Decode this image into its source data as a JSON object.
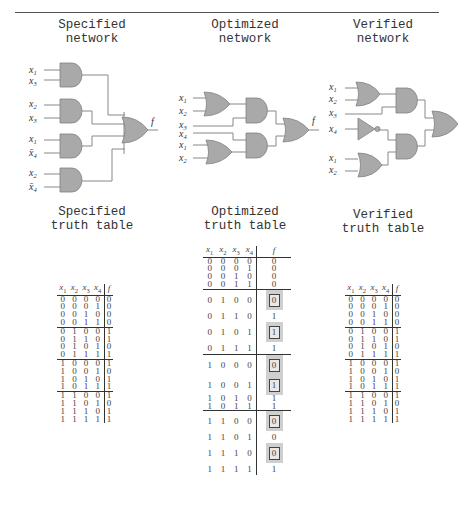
{
  "sections": {
    "specified": {
      "network_title": [
        "Specified",
        "network"
      ],
      "table_title": [
        "Specified",
        "truth table"
      ]
    },
    "optimized": {
      "network_title": [
        "Optimized",
        "network"
      ],
      "table_title": [
        "Optimized",
        "truth table"
      ]
    },
    "verified": {
      "network_title": [
        "Verified",
        "network"
      ],
      "table_title": [
        "Verified",
        "truth table"
      ]
    }
  },
  "networks": {
    "output_label": "f",
    "specified": {
      "gates": [
        {
          "type": "AND",
          "inputs": [
            "x1",
            "x3"
          ]
        },
        {
          "type": "AND",
          "inputs": [
            "x2",
            "x3"
          ]
        },
        {
          "type": "AND",
          "inputs": [
            "x1",
            "x̄4"
          ]
        },
        {
          "type": "AND",
          "inputs": [
            "x2",
            "x̄4"
          ]
        },
        {
          "type": "OR",
          "inputs": [
            "g1",
            "g2",
            "g3",
            "g4"
          ],
          "output": "f"
        }
      ],
      "input_labels": [
        "x1",
        "x3",
        "x2",
        "x3",
        "x1",
        "x̄4",
        "x2",
        "x̄4"
      ]
    },
    "optimized": {
      "gates": [
        {
          "type": "OR",
          "inputs": [
            "x1",
            "x2"
          ]
        },
        {
          "type": "AND",
          "inputs": [
            "or1",
            "x3"
          ]
        },
        {
          "type": "AND",
          "inputs": [
            "x4",
            "or2"
          ]
        },
        {
          "type": "OR",
          "inputs": [
            "x1",
            "x2"
          ]
        },
        {
          "type": "OR",
          "inputs": [
            "and1",
            "and2"
          ],
          "output": "f"
        }
      ],
      "input_labels": [
        "x1",
        "x2",
        "x3",
        "x4",
        "x1",
        "x2"
      ]
    },
    "verified": {
      "gates": [
        {
          "type": "OR",
          "inputs": [
            "x1",
            "x2"
          ]
        },
        {
          "type": "AND",
          "inputs": [
            "or1",
            "x3"
          ]
        },
        {
          "type": "NOT",
          "inputs": [
            "x4"
          ]
        },
        {
          "type": "AND",
          "inputs": [
            "not1",
            "or2"
          ]
        },
        {
          "type": "OR",
          "inputs": [
            "x1",
            "x2"
          ]
        },
        {
          "type": "OR",
          "inputs": [
            "and1",
            "and2"
          ],
          "output": "f"
        }
      ],
      "input_labels": [
        "x1",
        "x2",
        "x3",
        "x4",
        "x1",
        "x2"
      ]
    }
  },
  "tables": {
    "headers": [
      "x1",
      "x2",
      "x3",
      "x4",
      "f"
    ],
    "specified": {
      "rows": [
        [
          "0",
          "0",
          "0",
          "0",
          "0"
        ],
        [
          "0",
          "0",
          "0",
          "1",
          "0"
        ],
        [
          "0",
          "0",
          "1",
          "0",
          "0"
        ],
        [
          "0",
          "0",
          "1",
          "1",
          "0"
        ],
        [
          "0",
          "1",
          "0",
          "0",
          "1"
        ],
        [
          "0",
          "1",
          "1",
          "0",
          "1"
        ],
        [
          "0",
          "1",
          "0",
          "1",
          "0"
        ],
        [
          "0",
          "1",
          "1",
          "1",
          "1"
        ],
        [
          "1",
          "0",
          "0",
          "0",
          "1"
        ],
        [
          "1",
          "0",
          "0",
          "1",
          "0"
        ],
        [
          "1",
          "0",
          "1",
          "0",
          "1"
        ],
        [
          "1",
          "0",
          "1",
          "1",
          "1"
        ],
        [
          "1",
          "1",
          "0",
          "0",
          "1"
        ],
        [
          "1",
          "1",
          "0",
          "1",
          "0"
        ],
        [
          "1",
          "1",
          "1",
          "0",
          "1"
        ],
        [
          "1",
          "1",
          "1",
          "1",
          "1"
        ]
      ]
    },
    "optimized": {
      "rows": [
        [
          "0",
          "0",
          "0",
          "0",
          "0"
        ],
        [
          "0",
          "0",
          "0",
          "1",
          "0"
        ],
        [
          "0",
          "0",
          "1",
          "0",
          "0"
        ],
        [
          "0",
          "0",
          "1",
          "1",
          "0"
        ],
        [
          "0",
          "1",
          "0",
          "0",
          "0"
        ],
        [
          "0",
          "1",
          "1",
          "0",
          "1"
        ],
        [
          "0",
          "1",
          "0",
          "1",
          "1"
        ],
        [
          "0",
          "1",
          "1",
          "1",
          "1"
        ],
        [
          "1",
          "0",
          "0",
          "0",
          "0"
        ],
        [
          "1",
          "0",
          "0",
          "1",
          "1"
        ],
        [
          "1",
          "0",
          "1",
          "0",
          "1"
        ],
        [
          "1",
          "0",
          "1",
          "1",
          "1"
        ],
        [
          "1",
          "1",
          "0",
          "0",
          "0"
        ],
        [
          "1",
          "1",
          "0",
          "1",
          "0"
        ],
        [
          "1",
          "1",
          "1",
          "0",
          "0"
        ],
        [
          "1",
          "1",
          "1",
          "1",
          "1"
        ]
      ],
      "highlighted_rows": [
        4,
        6,
        8,
        9,
        12,
        14
      ]
    },
    "verified": {
      "rows": [
        [
          "0",
          "0",
          "0",
          "0",
          "0"
        ],
        [
          "0",
          "0",
          "0",
          "1",
          "0"
        ],
        [
          "0",
          "0",
          "1",
          "0",
          "0"
        ],
        [
          "0",
          "0",
          "1",
          "1",
          "0"
        ],
        [
          "0",
          "1",
          "0",
          "0",
          "1"
        ],
        [
          "0",
          "1",
          "1",
          "0",
          "1"
        ],
        [
          "0",
          "1",
          "0",
          "1",
          "0"
        ],
        [
          "0",
          "1",
          "1",
          "1",
          "1"
        ],
        [
          "1",
          "0",
          "0",
          "0",
          "1"
        ],
        [
          "1",
          "0",
          "0",
          "1",
          "0"
        ],
        [
          "1",
          "0",
          "1",
          "0",
          "1"
        ],
        [
          "1",
          "0",
          "1",
          "1",
          "1"
        ],
        [
          "1",
          "1",
          "0",
          "0",
          "1"
        ],
        [
          "1",
          "1",
          "0",
          "1",
          "0"
        ],
        [
          "1",
          "1",
          "1",
          "0",
          "1"
        ],
        [
          "1",
          "1",
          "1",
          "1",
          "1"
        ]
      ]
    }
  },
  "colors": {
    "gate_fill": "#a9a9a9",
    "gate_stroke": "#777777",
    "wire": "#888888",
    "highlight_bg": "#cfcfcf",
    "rule": "#555555"
  }
}
